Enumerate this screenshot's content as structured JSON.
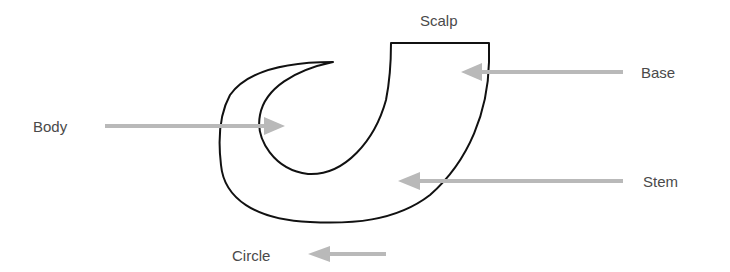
{
  "diagram": {
    "title": "",
    "labels": {
      "scalp": "Scalp",
      "base": "Base",
      "body": "Body",
      "stem": "Stem",
      "circle": "Circle"
    },
    "colors": {
      "outline": "#111111",
      "arrow": "#b9b9b9",
      "text": "#4a4a4a",
      "background": "#ffffff"
    },
    "arrows": [
      {
        "label": "Base",
        "direction": "left",
        "from": [
          623,
          72
        ],
        "to": [
          461,
          72
        ]
      },
      {
        "label": "Body",
        "direction": "right",
        "from": [
          105,
          126
        ],
        "to": [
          285,
          126
        ]
      },
      {
        "label": "Stem",
        "direction": "left",
        "from": [
          623,
          181
        ],
        "to": [
          398,
          181
        ]
      },
      {
        "label": "Circle",
        "direction": "left",
        "from": [
          386,
          254
        ],
        "to": [
          308,
          254
        ]
      }
    ]
  }
}
